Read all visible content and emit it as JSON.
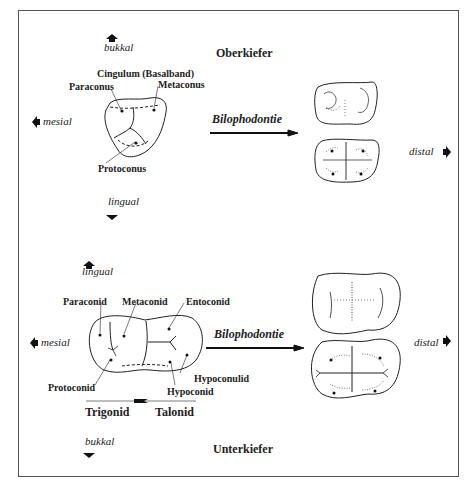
{
  "directions": {
    "upper_top": "bukkal",
    "upper_bottom": "lingual",
    "lower_top": "lingual",
    "lower_bottom": "bukkal",
    "mesial": "mesial",
    "distal": "distal"
  },
  "upper": {
    "title": "Oberkiefer",
    "process": "Bilophodontie",
    "labels": {
      "cingulum": "Cingulum (Basalband)",
      "paraconus": "Paraconus",
      "metaconus": "Metaconus",
      "protoconus": "Protoconus"
    }
  },
  "lower": {
    "title": "Unterkiefer",
    "process": "Bilophodontie",
    "labels": {
      "paraconid": "Paraconid",
      "metaconid": "Metaconid",
      "entoconid": "Entoconid",
      "protoconid": "Protoconid",
      "hypoconulid": "Hypoconulid",
      "hypoconid": "Hypoconid",
      "trigonid": "Trigonid",
      "talonid": "Talonid"
    }
  },
  "colors": {
    "ink": "#222222",
    "frame": "#555555"
  }
}
